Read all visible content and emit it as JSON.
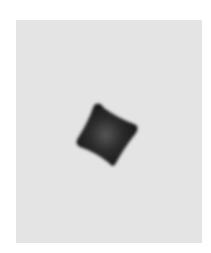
{
  "image": {
    "description": "Grayscale micrograph of a single dark cube-like nanoparticle with concave faces on a light gray background",
    "colors": {
      "page_background": "#ffffff",
      "panel_background": "#e4e4e4",
      "particle_edge": "#1a1a1a",
      "particle_center": "#4a4a4a"
    }
  }
}
